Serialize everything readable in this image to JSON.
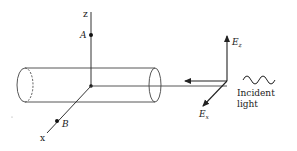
{
  "diagram": {
    "axes": {
      "z_label": "z",
      "x_label": "x"
    },
    "points": {
      "a_label": "A",
      "b_label": "B"
    },
    "fields": {
      "ez_base": "E",
      "ez_sub": "z",
      "ex_base": "E",
      "ex_sub": "x"
    },
    "incident": {
      "line1": "Incident",
      "line2": "light"
    },
    "colors": {
      "stroke": "#333333",
      "background": "#ffffff"
    }
  }
}
